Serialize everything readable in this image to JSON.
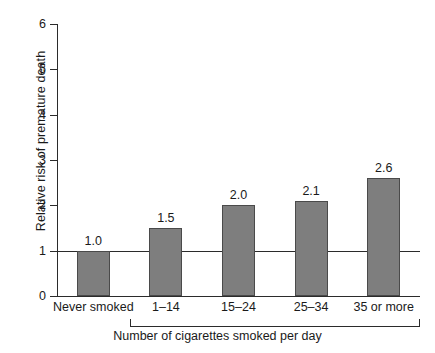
{
  "chart_data": {
    "type": "bar",
    "title": "",
    "xlabel": "Number of cigarettes smoked per day",
    "ylabel": "Relative risk of premature death",
    "categories": [
      "Never smoked",
      "1–14",
      "15–24",
      "25–34",
      "35 or more"
    ],
    "values": [
      1.0,
      1.5,
      2.0,
      2.1,
      2.6
    ],
    "value_labels": [
      "1.0",
      "1.5",
      "2.0",
      "2.1",
      "2.6"
    ],
    "ylim": [
      0,
      6
    ],
    "yticks": [
      0,
      1,
      2,
      3,
      4,
      5,
      6
    ],
    "ytick_labels": [
      "0",
      "1",
      "2",
      "3",
      "4",
      "5",
      "6"
    ],
    "grid": false,
    "legend": "none",
    "reference_line": {
      "value": 1.0,
      "label": ""
    },
    "group_bracket": {
      "caption": "Number of cigarettes smoked per day",
      "from_category": "1–14",
      "to_category": "35 or more"
    },
    "colors": {
      "bar_fill": "#7e7e7e",
      "bar_stroke": "#4a4a4a",
      "axis": "#2b2b2b",
      "text": "#1a1a1a",
      "background": "#ffffff"
    }
  }
}
